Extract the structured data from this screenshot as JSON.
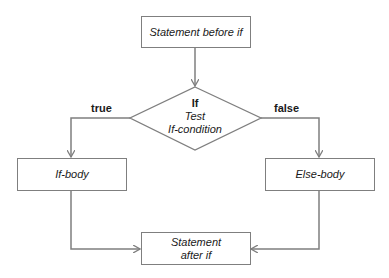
{
  "diagram": {
    "type": "flowchart",
    "colors": {
      "line": "#7f7f7f",
      "text": "#1a1a1a",
      "background": "#ffffff"
    },
    "nodes": {
      "start": {
        "label": "Statement before if"
      },
      "decision": {
        "line1": "If",
        "line2": "Test",
        "line3": "If-condition"
      },
      "if_body": {
        "label": "If-body"
      },
      "else_body": {
        "label": "Else-body"
      },
      "end": {
        "line1": "Statement",
        "line2": "after if"
      }
    },
    "edges": {
      "true_label": "true",
      "false_label": "false"
    }
  }
}
